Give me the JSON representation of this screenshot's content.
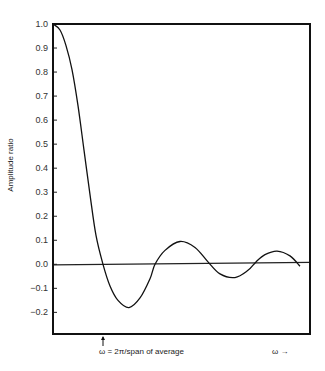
{
  "chart_data": {
    "type": "line",
    "title": "",
    "xlabel": "",
    "ylabel": "Amplitude ratio",
    "x_units_note": "omega normalized so that 1 = 2π/span of average",
    "xlim": [
      0,
      5.14
    ],
    "ylim": [
      -0.29,
      1.0
    ],
    "grid": false,
    "legend": "none",
    "yticks": [
      1.0,
      0.9,
      0.8,
      0.7,
      0.6,
      0.5,
      0.4,
      0.3,
      0.2,
      0.1,
      0.0,
      -0.1,
      -0.2
    ],
    "ytick_labels": [
      "1.0",
      "0.9",
      "0.8",
      "0.7",
      "0.6",
      "0.5",
      "0.4",
      "0.3",
      "0.2",
      "0.1",
      "0.0",
      "−0.1",
      "−0.2"
    ],
    "reference_line": {
      "y": 0.0
    },
    "series": [
      {
        "name": "amplitude ratio",
        "x": [
          0,
          0.14,
          0.26,
          0.38,
          0.5,
          0.62,
          0.74,
          0.86,
          1.0,
          1.14,
          1.3,
          1.52,
          1.74,
          1.94,
          2.04,
          2.24,
          2.54,
          2.84,
          3.1,
          3.34,
          3.64,
          3.9,
          4.06,
          4.24,
          4.48,
          4.74,
          4.94
        ],
        "y": [
          1.0,
          0.975,
          0.91,
          0.81,
          0.66,
          0.475,
          0.29,
          0.12,
          0.0,
          -0.09,
          -0.15,
          -0.18,
          -0.14,
          -0.06,
          0.0,
          0.058,
          0.095,
          0.07,
          0.01,
          -0.04,
          -0.055,
          -0.025,
          0.01,
          0.04,
          0.055,
          0.035,
          -0.008
        ]
      }
    ],
    "annotations": [
      {
        "text": "ω = 2π/span of average",
        "x": 1.0,
        "arrow": "up"
      },
      {
        "text": "ω →",
        "position": "bottom-right"
      }
    ]
  }
}
